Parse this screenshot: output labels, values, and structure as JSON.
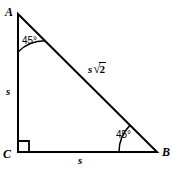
{
  "figure": {
    "type": "right-triangle-45-45-90",
    "background_color": "#ffffff",
    "stroke_color": "#000000",
    "stroke_width": 2,
    "vertices": {
      "A": {
        "label": "A",
        "x": 18,
        "y": 14
      },
      "B": {
        "label": "B",
        "x": 157,
        "y": 152
      },
      "C": {
        "label": "C",
        "x": 18,
        "y": 152
      }
    },
    "sides": [
      {
        "name": "leg-vertical",
        "from": "A",
        "to": "C",
        "label": "s"
      },
      {
        "name": "leg-horizontal",
        "from": "C",
        "to": "B",
        "label": "s"
      },
      {
        "name": "hypotenuse",
        "from": "A",
        "to": "B",
        "label_variable": "s",
        "label_radical": "√",
        "label_radicand": "2"
      }
    ],
    "angles": [
      {
        "at": "A",
        "label": "45°",
        "arc_radius": 38
      },
      {
        "at": "B",
        "label": "45°",
        "arc_radius": 38
      },
      {
        "at": "C",
        "label": "right-angle",
        "marker": "square",
        "marker_size": 11
      }
    ]
  }
}
